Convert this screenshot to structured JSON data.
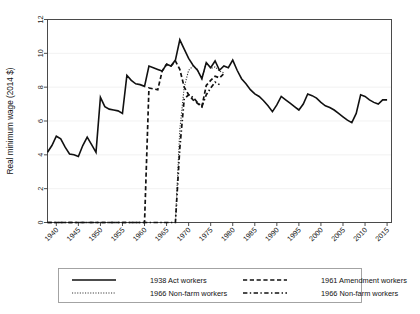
{
  "chart_data": {
    "type": "line",
    "title": "",
    "xlabel": "",
    "ylabel": "Real minimum wage (2014 $)",
    "xlim": [
      1938,
      2016
    ],
    "ylim": [
      0,
      12
    ],
    "xticks": [
      1940,
      1945,
      1950,
      1955,
      1960,
      1965,
      1970,
      1975,
      1980,
      1985,
      1990,
      1995,
      2000,
      2005,
      2010,
      2015
    ],
    "yticks": [
      0,
      2,
      4,
      6,
      8,
      10,
      12
    ],
    "grid": "horizontal-light",
    "legend_position": "bottom",
    "series": [
      {
        "name": "1938 Act workers",
        "style": "solid",
        "color": "#111111",
        "x": [
          1938,
          1939,
          1940,
          1941,
          1942,
          1943,
          1944,
          1945,
          1946,
          1947,
          1948,
          1949,
          1950,
          1951,
          1952,
          1953,
          1954,
          1955,
          1956,
          1957,
          1958,
          1959,
          1960,
          1961,
          1962,
          1963,
          1964,
          1965,
          1966,
          1967,
          1968,
          1969,
          1970,
          1971,
          1972,
          1973,
          1974,
          1975,
          1976,
          1977,
          1978,
          1979,
          1980,
          1981,
          1982,
          1983,
          1984,
          1985,
          1986,
          1987,
          1988,
          1989,
          1990,
          1991,
          1992,
          1993,
          1994,
          1995,
          1996,
          1997,
          1998,
          1999,
          2000,
          2001,
          2002,
          2003,
          2004,
          2005,
          2006,
          2007,
          2008,
          2009,
          2010,
          2011,
          2012,
          2013,
          2014,
          2015
        ],
        "y": [
          4.15,
          4.55,
          5.1,
          4.95,
          4.45,
          4.05,
          4.0,
          3.9,
          4.55,
          5.05,
          4.6,
          4.15,
          7.4,
          6.85,
          6.7,
          6.65,
          6.6,
          6.45,
          8.7,
          8.4,
          8.2,
          8.15,
          8.05,
          9.25,
          9.15,
          9.05,
          8.95,
          9.35,
          9.25,
          9.6,
          10.8,
          10.25,
          9.7,
          9.3,
          9.0,
          8.5,
          9.45,
          9.15,
          9.55,
          9.0,
          9.25,
          9.15,
          9.6,
          9.0,
          8.5,
          8.2,
          7.85,
          7.6,
          7.45,
          7.2,
          6.9,
          6.55,
          6.95,
          7.45,
          7.25,
          7.05,
          6.85,
          6.65,
          7.0,
          7.6,
          7.5,
          7.35,
          7.1,
          6.9,
          6.8,
          6.65,
          6.45,
          6.25,
          6.05,
          5.9,
          6.45,
          7.55,
          7.45,
          7.25,
          7.1,
          7.0,
          7.25,
          7.25
        ]
      },
      {
        "name": "1961 Amendment workers",
        "style": "dashed",
        "color": "#111111",
        "x": [
          1938,
          1940,
          1945,
          1950,
          1955,
          1960,
          1961,
          1962,
          1963,
          1964,
          1965,
          1966,
          1967,
          1968,
          1969,
          1970,
          1971,
          1972,
          1973,
          1974,
          1975,
          1976,
          1977,
          1978
        ],
        "y": [
          0,
          0,
          0,
          0,
          0,
          0,
          7.95,
          7.9,
          7.85,
          8.95,
          9.35,
          9.25,
          9.55,
          9.05,
          8.0,
          7.55,
          7.25,
          7.05,
          6.85,
          8.1,
          8.4,
          8.65,
          8.55,
          8.8
        ]
      },
      {
        "name": "1966 Non-farm workers",
        "style": "dotted",
        "color": "#777777",
        "x": [
          1967,
          1968,
          1969,
          1970,
          1971,
          1972,
          1973,
          1974,
          1975,
          1976,
          1977,
          1978
        ],
        "y": [
          0.0,
          5.5,
          8.0,
          9.0,
          9.25,
          9.05,
          8.5,
          9.45,
          9.1,
          9.2,
          8.95,
          8.85
        ]
      },
      {
        "name": "1966 Non-farm workers",
        "style": "dash-dot",
        "color": "#111111",
        "x": [
          1938,
          1945,
          1955,
          1965,
          1966,
          1967,
          1968,
          1969,
          1970,
          1971,
          1972,
          1973,
          1974,
          1975,
          1976,
          1977
        ],
        "y": [
          0,
          0,
          0,
          0,
          0,
          0.0,
          4.4,
          7.3,
          7.55,
          7.4,
          7.1,
          6.85,
          7.55,
          7.95,
          8.3,
          8.15
        ]
      }
    ]
  },
  "legend": {
    "entries": [
      {
        "label": "1938 Act workers",
        "style": "solid"
      },
      {
        "label": "1961 Amendment workers",
        "style": "dashed"
      },
      {
        "label": "1966 Non-farm workers",
        "style": "dotted"
      },
      {
        "label": "1966 Non-farm workers",
        "style": "dash-dot"
      }
    ]
  }
}
